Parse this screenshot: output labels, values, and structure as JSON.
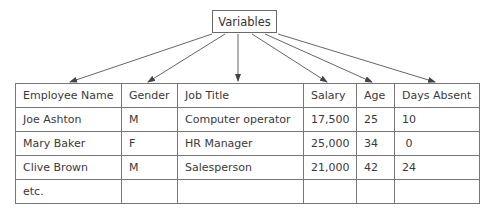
{
  "diagram": {
    "root_label": "Variables",
    "table": {
      "headers": [
        "Employee Name",
        "Gender",
        "Job Title",
        "Salary",
        "Age",
        "Days Absent"
      ],
      "rows": [
        [
          "Joe Ashton",
          "M",
          "Computer operator",
          "17,500",
          "25",
          "10"
        ],
        [
          "Mary Baker",
          "F",
          "HR Manager",
          "25,000",
          "34",
          " 0"
        ],
        [
          "Clive Brown",
          "M",
          "Salesperson",
          "21,000",
          "42",
          "24"
        ],
        [
          "etc.",
          "",
          "",
          "",
          "",
          ""
        ]
      ]
    },
    "edges": [
      {
        "from": "Variables",
        "to": "Employee Name"
      },
      {
        "from": "Variables",
        "to": "Gender"
      },
      {
        "from": "Variables",
        "to": "Job Title"
      },
      {
        "from": "Variables",
        "to": "Salary"
      },
      {
        "from": "Variables",
        "to": "Age"
      },
      {
        "from": "Variables",
        "to": "Days Absent"
      }
    ]
  }
}
